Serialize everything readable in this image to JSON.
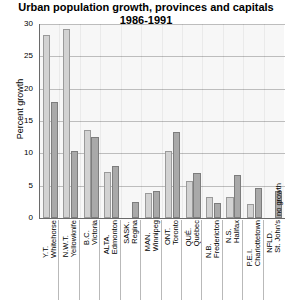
{
  "chart_data": {
    "type": "bar",
    "title": "Urban population growth, provinces and capitals",
    "subtitle": "1986-1991",
    "xlabel": "",
    "ylabel": "Percent growth",
    "ylim": [
      0,
      30
    ],
    "yticks": [
      0,
      5,
      10,
      15,
      20,
      25,
      30
    ],
    "grid": true,
    "legend": "none",
    "categories": [
      "Y.T. / Whitehorse",
      "N.W.T. / Yellowknife",
      "B.C. / Victoria",
      "ALTA. / Edmonton",
      "SASK. / Regina",
      "MAN. / Winnipeg",
      "ONT. / Toronto",
      "QUÉ. / Québec",
      "N.B. / Fredericton",
      "N.S. / Halifax",
      "P.E.I. / Charlottetown",
      "NFLD. / St. John's"
    ],
    "series": [
      {
        "name": "province",
        "values": [
          28.3,
          29.2,
          13.6,
          7.1,
          0.0,
          3.8,
          10.4,
          5.7,
          3.3,
          3.3,
          2.1,
          0.0
        ]
      },
      {
        "name": "capital",
        "values": [
          18.0,
          10.3,
          12.6,
          8.0,
          2.5,
          4.2,
          13.3,
          7.0,
          2.3,
          6.6,
          4.7,
          4.2
        ]
      }
    ],
    "annotations": [
      {
        "text": "no growth",
        "category": "NFLD. / St. John's",
        "series": "province"
      }
    ]
  },
  "axis": {
    "y_tick_labels": [
      "0",
      "5",
      "10",
      "15",
      "20",
      "25",
      "30"
    ],
    "y_title": "Percent growth"
  },
  "groups": [
    {
      "province_label": "Y.T.",
      "capital_label": "Whitehorse",
      "province_value": 28.3,
      "capital_value": 18.0
    },
    {
      "province_label": "N.W.T.",
      "capital_label": "Yellowknife",
      "province_value": 29.2,
      "capital_value": 10.3
    },
    {
      "province_label": "B.C.",
      "capital_label": "Victoria",
      "province_value": 13.6,
      "capital_value": 12.6
    },
    {
      "province_label": "ALTA.",
      "capital_label": "Edmonton",
      "province_value": 7.1,
      "capital_value": 8.0
    },
    {
      "province_label": "SASK.",
      "capital_label": "Regina",
      "province_value": 0.0,
      "capital_value": 2.5
    },
    {
      "province_label": "MAN.",
      "capital_label": "Winnipeg",
      "province_value": 3.8,
      "capital_value": 4.2
    },
    {
      "province_label": "ONT.",
      "capital_label": "Toronto",
      "province_value": 10.4,
      "capital_value": 13.3
    },
    {
      "province_label": "QUÉ.",
      "capital_label": "Québec",
      "province_value": 5.7,
      "capital_value": 7.0
    },
    {
      "province_label": "N.B.",
      "capital_label": "Fredericton",
      "province_value": 3.3,
      "capital_value": 2.3
    },
    {
      "province_label": "N.S.",
      "capital_label": "Halifax",
      "province_value": 3.3,
      "capital_value": 6.6
    },
    {
      "province_label": "P.E.I.",
      "capital_label": "Charlottetown",
      "province_value": 2.1,
      "capital_value": 4.7
    },
    {
      "province_label": "NFLD.",
      "capital_label": "St. John's",
      "province_value": 0.0,
      "capital_value": 4.2
    }
  ],
  "annotation": {
    "no_growth_label": "no growth"
  },
  "colors": {
    "province_bar": "#d2d2d2",
    "capital_bar": "#a9a9a9",
    "plot_background": "#f7f7f7",
    "gridline": "#bdbdbd",
    "axis": "#6a6a6a"
  }
}
